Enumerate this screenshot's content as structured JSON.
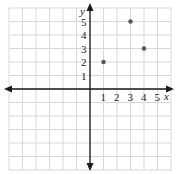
{
  "chart_data": {
    "type": "scatter",
    "title": "",
    "xlabel": "x",
    "ylabel": "y",
    "x_ticks": [
      "1",
      "2",
      "3",
      "4",
      "5"
    ],
    "y_ticks": [
      "1",
      "2",
      "3",
      "4",
      "5"
    ],
    "xlim": [
      -6,
      6
    ],
    "ylim": [
      -6,
      6
    ],
    "grid": true,
    "points": [
      {
        "x": 1,
        "y": 2
      },
      {
        "x": 3,
        "y": 5
      },
      {
        "x": 4,
        "y": 3
      }
    ],
    "colors": {
      "grid": "#d8d8d8",
      "axis": "#1a1a1a",
      "point": "#555555"
    }
  }
}
